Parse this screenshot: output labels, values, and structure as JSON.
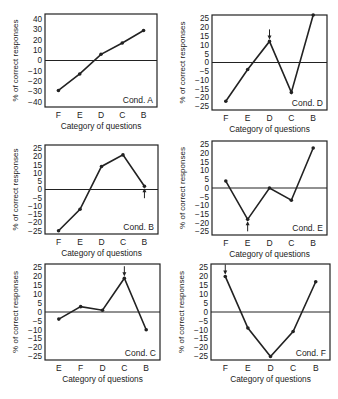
{
  "chart_data": [
    {
      "type": "line",
      "title": "Cond. A",
      "categories": [
        "F",
        "E",
        "D",
        "C",
        "B"
      ],
      "values": [
        -29,
        -13,
        6,
        17,
        29
      ],
      "xlabel": "Category of questions",
      "ylabel": "% of correct responses",
      "ylim": [
        -45,
        45
      ],
      "yticks": [
        40,
        30,
        20,
        10,
        0,
        -10,
        -20,
        -30,
        -40
      ],
      "arrow": null,
      "box": [
        45,
        14,
        157,
        107
      ]
    },
    {
      "type": "line",
      "title": "Cond. D",
      "categories": [
        "F",
        "E",
        "D",
        "C",
        "B"
      ],
      "values": [
        -22,
        -4,
        12,
        -17,
        27
      ],
      "xlabel": "Category of questions",
      "ylabel": "% of correct responses",
      "ylim": [
        -27,
        27
      ],
      "yticks": [
        25,
        20,
        15,
        10,
        5,
        0,
        -5,
        -10,
        -15,
        -20,
        -25
      ],
      "arrow": {
        "index": 2,
        "dir": "down"
      },
      "box": [
        212,
        15,
        327,
        110
      ]
    },
    {
      "type": "line",
      "title": "Cond. B",
      "categories": [
        "F",
        "E",
        "D",
        "C",
        "B"
      ],
      "values": [
        -25,
        -12,
        14,
        21,
        2
      ],
      "xlabel": "Category of questions",
      "ylabel": "% of correct responses",
      "ylim": [
        -27,
        27
      ],
      "yticks": [
        25,
        20,
        15,
        10,
        5,
        0,
        -5,
        -10,
        -15,
        -20,
        -25
      ],
      "arrow": {
        "index": 4,
        "dir": "up"
      },
      "box": [
        45,
        145,
        158,
        234
      ]
    },
    {
      "type": "line",
      "title": "Cond. E",
      "categories": [
        "F",
        "E",
        "D",
        "C",
        "B"
      ],
      "values": [
        4,
        -18,
        0,
        -7,
        23
      ],
      "xlabel": "Category of questions",
      "ylabel": "% of correct responses",
      "ylim": [
        -27,
        27
      ],
      "yticks": [
        25,
        20,
        15,
        10,
        5,
        0,
        -5,
        -10,
        -15,
        -20,
        -25
      ],
      "arrow": {
        "index": 1,
        "dir": "up"
      },
      "box": [
        212,
        141,
        327,
        235
      ]
    },
    {
      "type": "line",
      "title": "Cond. C",
      "categories": [
        "E",
        "F",
        "D",
        "C",
        "B"
      ],
      "values": [
        -4,
        3,
        1,
        19,
        -10
      ],
      "xlabel": "Category of questions",
      "ylabel": "% of correct responses",
      "ylim": [
        -27,
        27
      ],
      "yticks": [
        25,
        20,
        15,
        10,
        5,
        0,
        -5,
        -10,
        -15,
        -20,
        -25
      ],
      "arrow": {
        "index": 3,
        "dir": "down"
      },
      "box": [
        45,
        264,
        160,
        360
      ]
    },
    {
      "type": "line",
      "title": "Cond. F",
      "categories": [
        "F",
        "E",
        "D",
        "C",
        "B"
      ],
      "values": [
        20,
        -9,
        -25,
        -11,
        17
      ],
      "xlabel": "Category of questions",
      "ylabel": "% of correct responses",
      "ylim": [
        -27,
        27
      ],
      "yticks": [
        25,
        20,
        15,
        10,
        5,
        0,
        -5,
        -10,
        -15,
        -20,
        -25
      ],
      "arrow": {
        "index": 0,
        "dir": "down"
      },
      "box": [
        211,
        264,
        330,
        360
      ]
    }
  ]
}
